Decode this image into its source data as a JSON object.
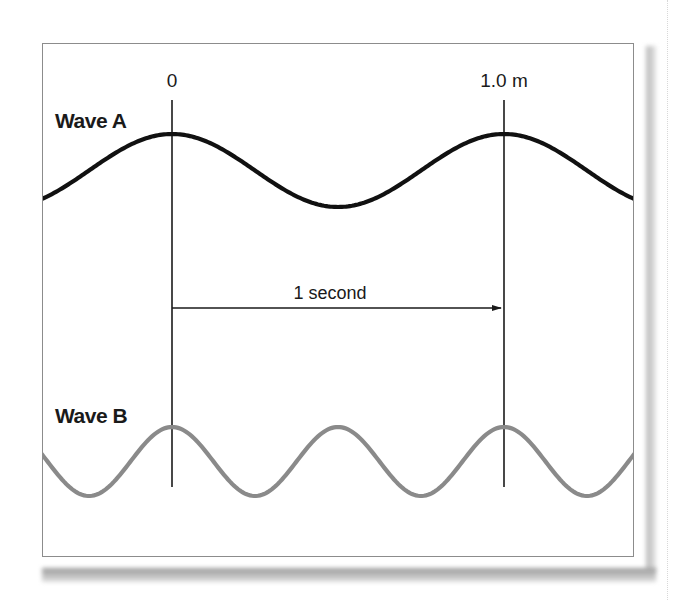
{
  "diagram": {
    "type": "wave-comparison",
    "markers": {
      "start_label": "0",
      "end_label": "1.0 m"
    },
    "interval": {
      "label": "1 second",
      "arrow_direction": "right"
    },
    "waves": [
      {
        "name": "Wave A",
        "color": "#111111",
        "wavelength": "1.0 m",
        "cycles_between_markers": 1
      },
      {
        "name": "Wave B",
        "color": "#8a8a8a",
        "wavelength": "0.5 m",
        "cycles_between_markers": 2
      }
    ]
  }
}
